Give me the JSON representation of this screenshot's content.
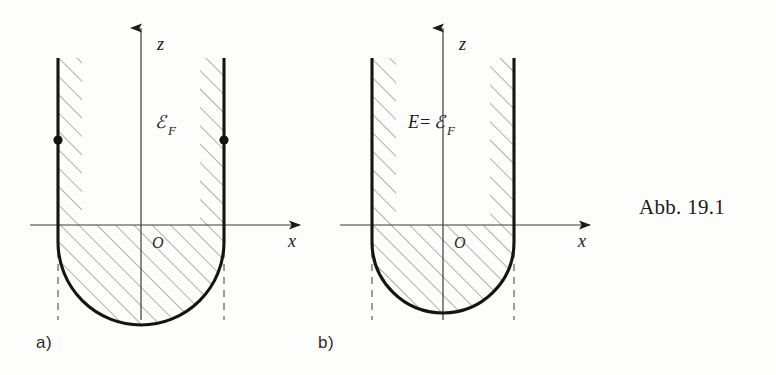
{
  "figure": {
    "caption": "Abb. 19.1",
    "kind": "line-drawing",
    "panels": [
      {
        "id": "a",
        "letter": "a)",
        "axis_z_label": "z",
        "axis_x_label": "x",
        "origin_label": "O",
        "energy_label": "ℰF",
        "energy_label_main": "ℰ",
        "energy_label_sub": "F",
        "has_endpoint_dots": true,
        "dot_count": 2
      },
      {
        "id": "b",
        "letter": "b)",
        "axis_z_label": "z",
        "axis_x_label": "x",
        "origin_label": "O",
        "energy_label": "E=ℰF",
        "energy_label_prefix": "E=",
        "energy_label_main": "ℰ",
        "energy_label_sub": "F",
        "has_endpoint_dots": false,
        "dot_count": 0
      }
    ]
  },
  "colors": {
    "ink": "#1a1a1a",
    "thin_ink": "#4a4a4a",
    "hatch": "#6b6b6b",
    "dash": "#6b6b6b",
    "paper": "#fdfdfc"
  }
}
